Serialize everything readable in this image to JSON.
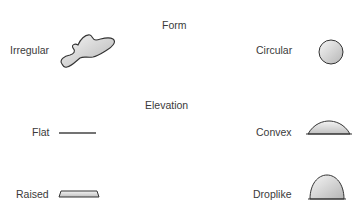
{
  "sections": {
    "form": {
      "heading": "Form",
      "items": [
        {
          "label": "Irregular",
          "shape": "irregular-blob"
        },
        {
          "label": "Circular",
          "shape": "circle"
        }
      ]
    },
    "elevation": {
      "heading": "Elevation",
      "items": [
        {
          "label": "Flat",
          "shape": "flat-line"
        },
        {
          "label": "Convex",
          "shape": "low-dome"
        },
        {
          "label": "Raised",
          "shape": "raised-plateau"
        },
        {
          "label": "Droplike",
          "shape": "high-dome"
        }
      ]
    }
  },
  "colors": {
    "outline": "#333333",
    "fill_light": "#f4f4f4",
    "fill_dark": "#b8b8b8"
  }
}
